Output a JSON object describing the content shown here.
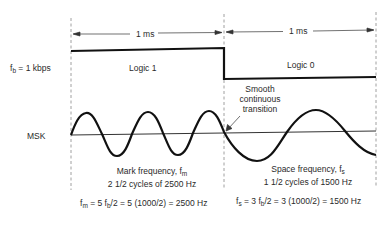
{
  "labels": {
    "bit_rate": "f",
    "bit_rate_sub": "b",
    "bit_rate_rest": " = 1 kbps",
    "msk": "MSK",
    "logic1": "Logic 1",
    "logic0": "Logic 0",
    "duration1": "1 ms",
    "duration2": "1 ms",
    "transition_line1": "Smooth",
    "transition_line2": "continuous",
    "transition_line3": "transition",
    "mark_line1": "Mark frequency, f",
    "mark_line1_sub": "m",
    "mark_line2": "2 1/2 cycles of 2500 Hz",
    "space_line1": "Space frequency, f",
    "space_line1_sub": "s",
    "space_line2": "1 1/2 cycles of 1500 Hz",
    "mark_eq_pre": "f",
    "mark_eq_sub1": "m",
    "mark_eq_mid": " = 5 f",
    "mark_eq_sub2": "b",
    "mark_eq_post": "/2 = 5 (1000/2) = 2500 Hz",
    "space_eq_pre": "f",
    "space_eq_sub1": "s",
    "space_eq_mid": " = 3 f",
    "space_eq_sub2": "b",
    "space_eq_post": "/2 = 3 (1000/2) = 1500 Hz"
  },
  "signal": {
    "bit_rate_kbps": 1,
    "bits": [
      1,
      0
    ],
    "bit_duration_ms": 1,
    "mark_frequency_hz": 2500,
    "space_frequency_hz": 1500,
    "mark_cycles": 2.5,
    "space_cycles": 1.5
  },
  "colors": {
    "line": "#111111",
    "dashed": "#777777",
    "text": "#2a2a2a"
  }
}
